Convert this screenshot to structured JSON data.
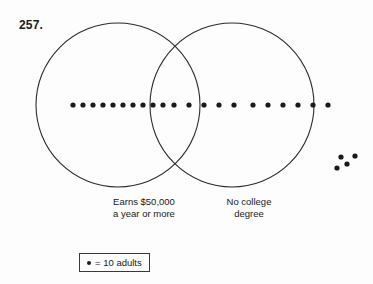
{
  "problem": {
    "number": "257."
  },
  "diagram": {
    "type": "venn",
    "sets": [
      {
        "id": "left",
        "label": "Earns $50,000\na year or more",
        "cx": 118,
        "cy": 105,
        "r": 82
      },
      {
        "id": "right",
        "label": "No college\ndegree",
        "cx": 232,
        "cy": 105,
        "r": 82
      }
    ],
    "dot_color": "#1a1a1a",
    "stroke_color": "#2b2b2b",
    "regions": [
      {
        "id": "left-only",
        "count": 10,
        "adults": 100,
        "dots": [
          {
            "x": 73,
            "y": 105
          },
          {
            "x": 83,
            "y": 105
          },
          {
            "x": 93,
            "y": 105
          },
          {
            "x": 103,
            "y": 105
          },
          {
            "x": 113,
            "y": 105
          },
          {
            "x": 123,
            "y": 105
          },
          {
            "x": 133,
            "y": 105
          },
          {
            "x": 143,
            "y": 105
          },
          {
            "x": 153,
            "y": 105
          },
          {
            "x": 163,
            "y": 105
          }
        ]
      },
      {
        "id": "intersection",
        "count": 5,
        "adults": 50,
        "dots": [
          {
            "x": 174,
            "y": 105
          },
          {
            "x": 189,
            "y": 105
          },
          {
            "x": 204,
            "y": 105
          },
          {
            "x": 219,
            "y": 105
          },
          {
            "x": 234,
            "y": 105
          }
        ]
      },
      {
        "id": "right-only",
        "count": 6,
        "adults": 60,
        "dots": [
          {
            "x": 253,
            "y": 105
          },
          {
            "x": 268,
            "y": 105
          },
          {
            "x": 283,
            "y": 105
          },
          {
            "x": 298,
            "y": 105
          },
          {
            "x": 313,
            "y": 105
          },
          {
            "x": 328,
            "y": 105
          }
        ]
      },
      {
        "id": "outside",
        "count": 4,
        "adults": 40,
        "dots": [
          {
            "x": 341,
            "y": 157
          },
          {
            "x": 355,
            "y": 156
          },
          {
            "x": 347,
            "y": 164
          },
          {
            "x": 337,
            "y": 168
          }
        ]
      }
    ]
  },
  "legend": {
    "symbol": "dot-icon",
    "text": "= 10 adults",
    "unit_value": 10,
    "unit_name": "adults"
  }
}
